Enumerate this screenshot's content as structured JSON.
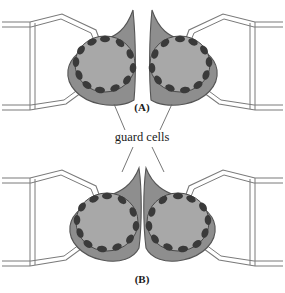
{
  "figure": {
    "background_color": "#ffffff",
    "width": 285,
    "height": 293
  },
  "colors": {
    "background": "#ffffff",
    "cell_wall_stroke": "#7a7a7a",
    "guard_cell_fill": "#8e8e8e",
    "vacuole_fill": "#a8a8a8",
    "chloroplast_fill": "#3a3a3a",
    "outline_stroke": "#555555",
    "text": "#1a1a1a",
    "leader_line": "#666666"
  },
  "labels": {
    "panel_a": "(A)",
    "panel_b": "(B)",
    "callout": "guard cells"
  },
  "panels": [
    {
      "id": "A",
      "label": "(A)",
      "state": "open",
      "pore_description": "stomatal pore wide open",
      "guard_cells": [
        {
          "side": "left",
          "chloroplast_count": 12,
          "vacuole_shape": "rounded"
        },
        {
          "side": "right",
          "chloroplast_count": 12,
          "vacuole_shape": "rounded"
        }
      ],
      "epidermal_cells": 2
    },
    {
      "id": "B",
      "label": "(B)",
      "state": "closed",
      "pore_description": "stomatal pore closed, guard cells touching",
      "guard_cells": [
        {
          "side": "left",
          "chloroplast_count": 12,
          "vacuole_shape": "rounded"
        },
        {
          "side": "right",
          "chloroplast_count": 12,
          "vacuole_shape": "rounded"
        }
      ],
      "epidermal_cells": 2
    }
  ],
  "callout": {
    "text": "guard cells",
    "x": 142,
    "y": 139,
    "points_to": [
      "panel-a-left-guard-cell",
      "panel-a-right-guard-cell",
      "panel-b-left-guard-cell",
      "panel-b-right-guard-cell"
    ]
  }
}
